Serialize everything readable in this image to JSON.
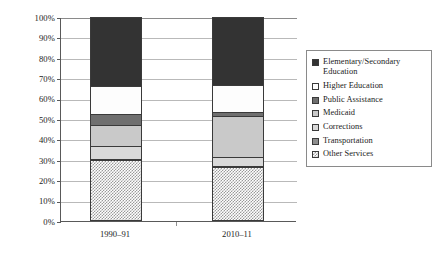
{
  "chart_data": {
    "type": "bar",
    "subtype": "stacked-100-percent",
    "title": "",
    "subtitle": "",
    "xlabel": "",
    "ylabel": "",
    "ylim": [
      0,
      100
    ],
    "ytick_labels": [
      "100%",
      "90%",
      "80%",
      "70%",
      "60%",
      "50%",
      "40%",
      "30%",
      "20%",
      "10%",
      "0%"
    ],
    "ytick_values": [
      100,
      90,
      80,
      70,
      60,
      50,
      40,
      30,
      20,
      10,
      0
    ],
    "grid": true,
    "legend_position": "right",
    "categories": [
      "1990–91",
      "2010–11"
    ],
    "series": [
      {
        "name": "Elementary/Secondary Education",
        "values": [
          34.0,
          33.5
        ],
        "color": "#333333",
        "pattern": "solid-dark"
      },
      {
        "name": "Higher Education",
        "values": [
          13.5,
          13.0
        ],
        "color": "#fdfdfd",
        "pattern": "solid-white"
      },
      {
        "name": "Public Assistance",
        "values": [
          5.5,
          2.0
        ],
        "color": "#6f6f6f",
        "pattern": "solid-medium-dark"
      },
      {
        "name": "Medicaid",
        "values": [
          10.0,
          20.0
        ],
        "color": "#c9c9c9",
        "pattern": "solid-light"
      },
      {
        "name": "Corrections",
        "values": [
          6.5,
          4.5
        ],
        "color": "#d9d9d9",
        "pattern": "solid-lighter"
      },
      {
        "name": "Transportation",
        "values": [
          0.5,
          0.5
        ],
        "color": "#8e8e8e",
        "pattern": "solid-gray"
      },
      {
        "name": "Other Services",
        "values": [
          30.0,
          26.5
        ],
        "color": "#9a9a9a",
        "pattern": "checkerboard"
      }
    ],
    "stack_order_bottom_to_top": [
      "Other Services",
      "Transportation",
      "Corrections",
      "Medicaid",
      "Public Assistance",
      "Higher Education",
      "Elementary/Secondary Education"
    ],
    "bars": [
      {
        "category": "1990–91",
        "segments_bottom_to_top": [
          {
            "name": "Other Services",
            "start": 0.0,
            "end": 30.0
          },
          {
            "name": "Transportation",
            "start": 30.0,
            "end": 30.5
          },
          {
            "name": "Corrections",
            "start": 30.5,
            "end": 37.0
          },
          {
            "name": "Medicaid",
            "start": 37.0,
            "end": 47.0
          },
          {
            "name": "Public Assistance",
            "start": 47.0,
            "end": 52.5
          },
          {
            "name": "Higher Education",
            "start": 52.5,
            "end": 66.0
          },
          {
            "name": "Elementary/Secondary Education",
            "start": 66.0,
            "end": 100.0
          }
        ]
      },
      {
        "category": "2010–11",
        "segments_bottom_to_top": [
          {
            "name": "Other Services",
            "start": 0.0,
            "end": 26.5
          },
          {
            "name": "Transportation",
            "start": 26.5,
            "end": 27.0
          },
          {
            "name": "Corrections",
            "start": 27.0,
            "end": 31.5
          },
          {
            "name": "Medicaid",
            "start": 31.5,
            "end": 51.5
          },
          {
            "name": "Public Assistance",
            "start": 51.5,
            "end": 53.5
          },
          {
            "name": "Higher Education",
            "start": 53.5,
            "end": 66.5
          },
          {
            "name": "Elementary/Secondary Education",
            "start": 66.5,
            "end": 100.0
          }
        ]
      }
    ]
  },
  "legend": {
    "items": [
      {
        "label": "Elementary/Secondary Education",
        "swatch": "elemsec"
      },
      {
        "label": "Higher Education",
        "swatch": "higher"
      },
      {
        "label": "Public Assistance",
        "swatch": "pubassist"
      },
      {
        "label": "Medicaid",
        "swatch": "medicaid"
      },
      {
        "label": "Corrections",
        "swatch": "correct"
      },
      {
        "label": "Transportation",
        "swatch": "transport"
      },
      {
        "label": "Other Services",
        "swatch": "other"
      }
    ]
  },
  "axis": {
    "y_labels": [
      "100%",
      "90%",
      "80%",
      "70%",
      "60%",
      "50%",
      "40%",
      "30%",
      "20%",
      "10%",
      "0%"
    ],
    "x_labels": [
      "1990–91",
      "2010–11"
    ]
  }
}
